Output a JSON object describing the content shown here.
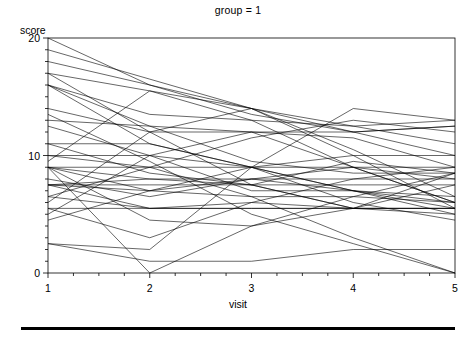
{
  "figure": {
    "title": "group = 1",
    "bottom_rule": "horizontal-rule"
  },
  "axes": {
    "ylabel": "score",
    "xlabel": "visit",
    "y_ticks": [
      "0",
      "10",
      "20"
    ],
    "x_ticks": [
      "1",
      "2",
      "3",
      "4",
      "5"
    ]
  },
  "chart_data": {
    "type": "line",
    "title": "group = 1",
    "xlabel": "visit",
    "ylabel": "score",
    "x": [
      1,
      2,
      3,
      4,
      5
    ],
    "xlim": [
      1,
      5
    ],
    "ylim": [
      0,
      20
    ],
    "x_ticks": [
      1,
      2,
      3,
      4,
      5
    ],
    "y_ticks": [
      0,
      10,
      20
    ],
    "y_minor_tick_step": 1,
    "grid": false,
    "legend": "none",
    "line_color": "#000000",
    "line_width": 0.6,
    "series": [
      {
        "name": "subject-01",
        "values": [
          20.0,
          16.0,
          14.0,
          12.5,
          11.0
        ]
      },
      {
        "name": "subject-02",
        "values": [
          19.0,
          16.5,
          14.0,
          12.0,
          10.0
        ]
      },
      {
        "name": "subject-03",
        "values": [
          18.0,
          16.0,
          13.5,
          12.0,
          12.5
        ]
      },
      {
        "name": "subject-04",
        "values": [
          17.0,
          15.5,
          13.0,
          9.0,
          6.0
        ]
      },
      {
        "name": "subject-05",
        "values": [
          16.0,
          13.5,
          13.0,
          12.5,
          13.0
        ]
      },
      {
        "name": "subject-06",
        "values": [
          16.0,
          12.5,
          12.0,
          9.0,
          8.0
        ]
      },
      {
        "name": "subject-07",
        "values": [
          16.0,
          11.0,
          9.0,
          7.0,
          5.0
        ]
      },
      {
        "name": "subject-08",
        "values": [
          14.0,
          12.0,
          12.0,
          12.0,
          12.5
        ]
      },
      {
        "name": "subject-09",
        "values": [
          13.0,
          12.5,
          9.5,
          8.5,
          8.5
        ]
      },
      {
        "name": "subject-10",
        "values": [
          11.0,
          11.0,
          9.0,
          10.0,
          10.0
        ]
      },
      {
        "name": "subject-11",
        "values": [
          10.0,
          10.0,
          9.0,
          7.0,
          5.5
        ]
      },
      {
        "name": "subject-12",
        "values": [
          9.0,
          9.0,
          9.0,
          9.0,
          9.0
        ]
      },
      {
        "name": "subject-13",
        "values": [
          9.0,
          8.0,
          8.0,
          8.0,
          8.0
        ]
      },
      {
        "name": "subject-14",
        "values": [
          9.0,
          7.0,
          8.0,
          7.0,
          6.0
        ]
      },
      {
        "name": "subject-15",
        "values": [
          7.5,
          7.5,
          7.5,
          7.5,
          7.5
        ]
      },
      {
        "name": "subject-16",
        "values": [
          7.5,
          7.0,
          6.5,
          6.5,
          6.0
        ]
      },
      {
        "name": "subject-17",
        "values": [
          7.5,
          5.5,
          5.5,
          5.5,
          5.5
        ]
      },
      {
        "name": "subject-18",
        "values": [
          6.5,
          9.0,
          11.5,
          13.0,
          12.0
        ]
      },
      {
        "name": "subject-19",
        "values": [
          6.5,
          5.5,
          6.0,
          5.5,
          5.5
        ]
      },
      {
        "name": "subject-20",
        "values": [
          5.5,
          5.5,
          5.5,
          5.5,
          5.0
        ]
      },
      {
        "name": "subject-21",
        "values": [
          5.5,
          3.0,
          6.0,
          8.0,
          9.0
        ]
      },
      {
        "name": "subject-22",
        "values": [
          5.0,
          10.0,
          12.0,
          11.5,
          9.0
        ]
      },
      {
        "name": "subject-23",
        "values": [
          4.5,
          7.0,
          9.0,
          6.0,
          4.5
        ]
      },
      {
        "name": "subject-24",
        "values": [
          2.5,
          1.0,
          1.0,
          2.0,
          2.0
        ]
      },
      {
        "name": "subject-25",
        "values": [
          2.5,
          2.0,
          9.0,
          14.0,
          13.0
        ]
      },
      {
        "name": "subject-26",
        "values": [
          9.5,
          15.5,
          14.0,
          10.5,
          6.5
        ]
      },
      {
        "name": "subject-27",
        "values": [
          6.0,
          12.0,
          14.0,
          10.0,
          5.5
        ]
      },
      {
        "name": "subject-28",
        "values": [
          10.0,
          9.0,
          6.5,
          3.0,
          0.0
        ]
      },
      {
        "name": "subject-29",
        "values": [
          13.5,
          9.5,
          5.0,
          2.5,
          0.0
        ]
      },
      {
        "name": "subject-30",
        "values": [
          17.0,
          12.0,
          7.5,
          5.5,
          8.5
        ]
      },
      {
        "name": "subject-31",
        "values": [
          11.0,
          8.5,
          7.5,
          9.5,
          8.5
        ]
      },
      {
        "name": "subject-32",
        "values": [
          7.5,
          8.0,
          7.5,
          5.5,
          5.5
        ]
      },
      {
        "name": "subject-33",
        "values": [
          9.0,
          4.5,
          4.0,
          5.5,
          7.5
        ]
      },
      {
        "name": "subject-34",
        "values": [
          12.5,
          10.0,
          7.0,
          7.0,
          6.5
        ]
      },
      {
        "name": "subject-35",
        "values": [
          8.0,
          6.5,
          8.0,
          9.0,
          6.0
        ]
      },
      {
        "name": "subject-36",
        "values": [
          9.0,
          0.0,
          4.0,
          6.5,
          8.5
        ]
      }
    ]
  }
}
